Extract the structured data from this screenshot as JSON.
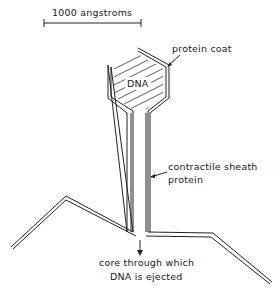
{
  "diagram": {
    "scale_bar": {
      "label": "1000 angstroms"
    },
    "head": {
      "inner_label": "DNA",
      "callout": "protein coat"
    },
    "tail": {
      "callout_line1": "contractile sheath",
      "callout_line2": "protein"
    },
    "core": {
      "callout_line1": "core through which",
      "callout_line2": "DNA is ejected"
    },
    "colors": {
      "line": "#222222",
      "background": "#ffffff"
    }
  }
}
